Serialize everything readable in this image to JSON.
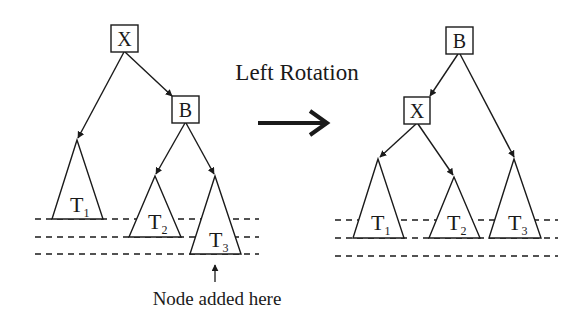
{
  "title": "Left Rotation",
  "caption": "Node added here",
  "colors": {
    "stroke": "#1a1a1a",
    "background": "#ffffff"
  },
  "before_tree": {
    "root": {
      "label": "X"
    },
    "right_child": {
      "label": "B"
    },
    "subtrees": [
      {
        "label": "T",
        "sub": "1",
        "parent": "X",
        "side": "left"
      },
      {
        "label": "T",
        "sub": "2",
        "parent": "B",
        "side": "left"
      },
      {
        "label": "T",
        "sub": "3",
        "parent": "B",
        "side": "right",
        "note": "Node added here"
      }
    ]
  },
  "after_tree": {
    "root": {
      "label": "B"
    },
    "left_child": {
      "label": "X"
    },
    "subtrees": [
      {
        "label": "T",
        "sub": "1",
        "parent": "X",
        "side": "left"
      },
      {
        "label": "T",
        "sub": "2",
        "parent": "X",
        "side": "right"
      },
      {
        "label": "T",
        "sub": "3",
        "parent": "B",
        "side": "right"
      }
    ]
  },
  "transition_arrow": {
    "icon": "right-arrow-icon"
  },
  "level_lines": {
    "count": 3,
    "style": "dashed"
  }
}
